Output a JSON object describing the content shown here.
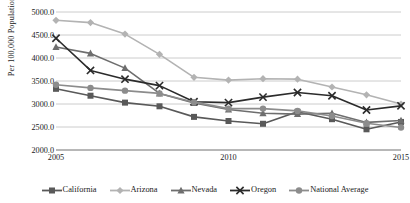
{
  "chart_data": {
    "type": "line",
    "title": "",
    "xlabel": "",
    "ylabel": "Per 100,000 Population",
    "x": [
      2005,
      2006,
      2007,
      2008,
      2009,
      2010,
      2011,
      2012,
      2013,
      2014,
      2015
    ],
    "xtick_labels": [
      "2005",
      "2010",
      "2015"
    ],
    "xtick_values": [
      2005,
      2010,
      2015
    ],
    "xlim": [
      2005,
      2015
    ],
    "ylim": [
      2000,
      5000
    ],
    "ytick_labels": [
      "2000.0",
      "2500.0",
      "3000.0",
      "3500.0",
      "4000.0",
      "4500.0",
      "5000.0"
    ],
    "ytick_values": [
      2000,
      2500,
      3000,
      3500,
      4000,
      4500,
      5000
    ],
    "grid": "horizontal",
    "legend_position": "bottom",
    "series": [
      {
        "name": "California",
        "marker": "square",
        "color": "#595959",
        "values": [
          3330,
          3180,
          3030,
          2950,
          2720,
          2630,
          2570,
          2830,
          2670,
          2450,
          2610
        ]
      },
      {
        "name": "Arizona",
        "marker": "diamond",
        "color": "#b3b3b3",
        "values": [
          4820,
          4770,
          4520,
          4080,
          3580,
          3520,
          3550,
          3540,
          3370,
          3200,
          3000
        ]
      },
      {
        "name": "Nevada",
        "marker": "triangle",
        "color": "#6e6e6e",
        "values": [
          4240,
          4100,
          3780,
          3230,
          3020,
          2880,
          2800,
          2780,
          2800,
          2600,
          2640
        ]
      },
      {
        "name": "Oregon",
        "marker": "x",
        "color": "#2b2b2b",
        "values": [
          4430,
          3730,
          3540,
          3400,
          3050,
          3030,
          3150,
          3250,
          3180,
          2870,
          2960
        ]
      },
      {
        "name": "National Average",
        "marker": "circle",
        "color": "#8c8c8c",
        "values": [
          3420,
          3350,
          3290,
          3230,
          3040,
          2900,
          2900,
          2850,
          2740,
          2580,
          2490
        ]
      }
    ]
  },
  "axis": {
    "y_title": "Per 100,000 Population"
  },
  "legend": {
    "items": [
      {
        "label": "California"
      },
      {
        "label": "Arizona"
      },
      {
        "label": "Nevada"
      },
      {
        "label": "Oregon"
      },
      {
        "label": "National Average"
      }
    ]
  }
}
